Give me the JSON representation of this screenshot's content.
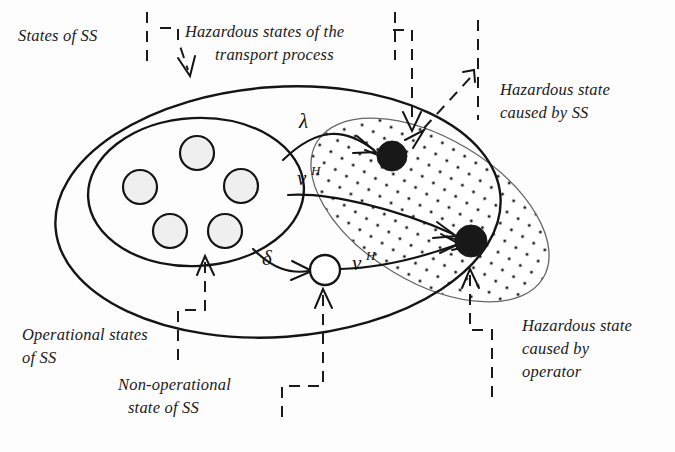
{
  "figure": {
    "background_color": "#fdfdfd",
    "ink_color": "#141414"
  },
  "labels": {
    "states_of_ss": "States of SS",
    "hazardous_states_transport_line1": "Hazardous states of the",
    "hazardous_states_transport_line2": "transport process",
    "hazardous_state_ss_line1": "Hazardous state",
    "hazardous_state_ss_line2": "caused by SS",
    "operational_states_line1": "Operational  states",
    "operational_states_line2": "of SS",
    "non_operational_line1": "Non-operational",
    "non_operational_line2": "state of SS",
    "hazardous_state_operator_line1": "Hazardous state",
    "hazardous_state_operator_line2": "caused by",
    "hazardous_state_operator_line3": "operator"
  },
  "transitions": [
    {
      "id": "lambda",
      "symbol": "λ",
      "superscript": "",
      "from": "operational-states",
      "to": "hazardous-state-ss"
    },
    {
      "id": "nu-h-top",
      "symbol": "ν",
      "superscript": "H",
      "from": "operational-states",
      "to": "hazardous-state-operator"
    },
    {
      "id": "delta",
      "symbol": "δ",
      "superscript": "",
      "from": "operational-states",
      "to": "non-operational-state"
    },
    {
      "id": "nu-h-bottom",
      "symbol": "ν",
      "superscript": "H",
      "from": "non-operational-state",
      "to": "hazardous-state-operator"
    }
  ],
  "regions": {
    "outer": {
      "name": "States of SS",
      "fill": "#ffffff",
      "stroke": "#141414"
    },
    "operational": {
      "name": "Operational states of SS",
      "fill": "#ebebeb",
      "stroke": "#141414",
      "state_count": 5
    },
    "hazardous_transport": {
      "name": "Hazardous states of the transport process",
      "fill": "dotted",
      "stroke": "#555555"
    }
  },
  "nodes": [
    {
      "id": "hazardous-state-ss",
      "kind": "filled",
      "color": "#181818"
    },
    {
      "id": "hazardous-state-operator",
      "kind": "filled",
      "color": "#181818"
    },
    {
      "id": "non-operational-state",
      "kind": "open",
      "color": "#ffffff"
    }
  ]
}
